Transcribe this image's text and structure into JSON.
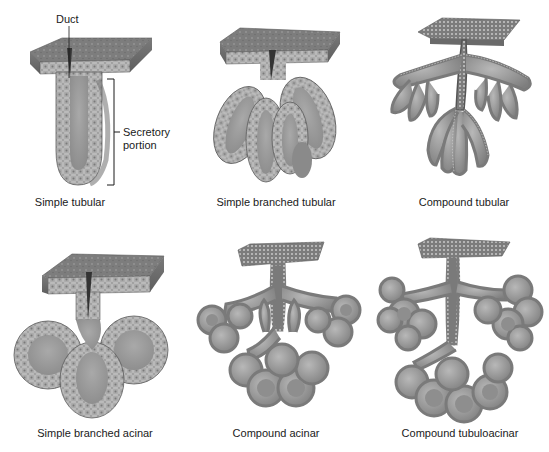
{
  "figure": {
    "palette": {
      "tissue_dark": "#6e6e6e",
      "tissue_mid": "#8c8c8c",
      "tissue_light": "#b4b4b4",
      "lumen": "#9a9a9a",
      "cell_outline": "#d8d8d8",
      "line": "#1a1a1a",
      "background": "#ffffff"
    },
    "panels": [
      {
        "id": "simple-tubular",
        "caption": "Simple tubular",
        "annotations": {
          "duct": "Duct",
          "secretory_line1": "Secretory",
          "secretory_line2": "portion"
        }
      },
      {
        "id": "simple-branched-tubular",
        "caption": "Simple branched tubular"
      },
      {
        "id": "compound-tubular",
        "caption": "Compound tubular"
      },
      {
        "id": "simple-branched-acinar",
        "caption": "Simple branched acinar"
      },
      {
        "id": "compound-acinar",
        "caption": "Compound acinar"
      },
      {
        "id": "compound-tubuloacinar",
        "caption": "Compound tubuloacinar"
      }
    ]
  }
}
